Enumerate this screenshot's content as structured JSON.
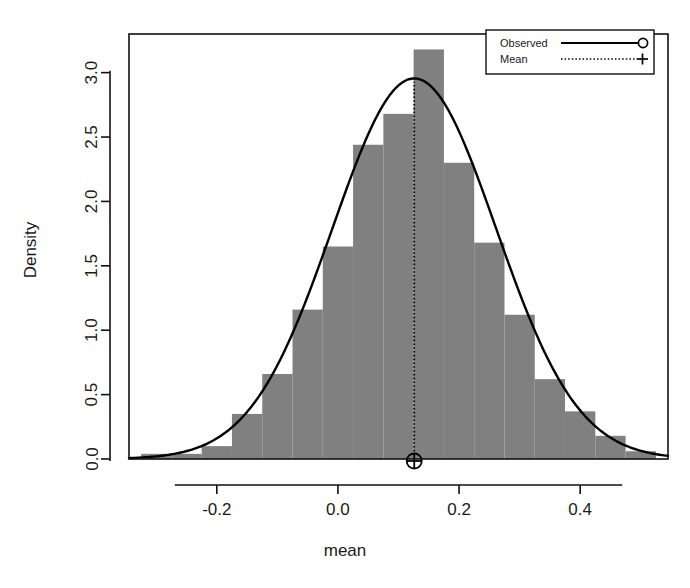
{
  "chart_data": {
    "type": "bar",
    "title": "",
    "subtitle": "",
    "xlabel": "mean",
    "ylabel": "Density",
    "xlim": [
      -0.345,
      0.545
    ],
    "ylim": [
      0.0,
      3.3
    ],
    "xticks": [
      -0.2,
      0.0,
      0.2,
      0.4
    ],
    "xticklabels": [
      "-0.2",
      "0.0",
      "0.2",
      "0.4"
    ],
    "yticks": [
      0.0,
      0.5,
      1.0,
      1.5,
      2.0,
      2.5,
      3.0
    ],
    "yticklabels": [
      "0.0",
      "0.5",
      "1.0",
      "1.5",
      "2.0",
      "2.5",
      "3.0"
    ],
    "grid": false,
    "bin_width": 0.05,
    "bin_edges": [
      -0.325,
      -0.275,
      -0.225,
      -0.175,
      -0.125,
      -0.075,
      -0.025,
      0.025,
      0.075,
      0.125,
      0.175,
      0.225,
      0.275,
      0.325,
      0.375,
      0.425,
      0.475,
      0.525
    ],
    "bin_centers": [
      -0.3,
      -0.25,
      -0.2,
      -0.15,
      -0.1,
      -0.05,
      0.0,
      0.05,
      0.1,
      0.15,
      0.2,
      0.25,
      0.3,
      0.35,
      0.4,
      0.45,
      0.5
    ],
    "values": [
      0.04,
      0.04,
      0.1,
      0.35,
      0.66,
      1.16,
      1.65,
      2.44,
      2.68,
      3.18,
      2.3,
      1.68,
      1.12,
      0.62,
      0.37,
      0.18,
      0.06
    ],
    "series": [
      {
        "name": "Histogram",
        "kind": "bar",
        "values": [
          0.04,
          0.04,
          0.1,
          0.35,
          0.66,
          1.16,
          1.65,
          2.44,
          2.68,
          3.18,
          2.3,
          1.68,
          1.12,
          0.62,
          0.37,
          0.18,
          0.06
        ]
      },
      {
        "name": "Observed",
        "kind": "line",
        "distribution": "normal",
        "mean": 0.126,
        "sd": 0.135,
        "peak": 2.95
      },
      {
        "name": "Mean",
        "kind": "vline",
        "x": 0.126,
        "marker": "circle-plus",
        "line_style": "dotted"
      }
    ],
    "annotations": {
      "mean_value": 0.126,
      "mean_marker_label": "mean-marker"
    },
    "legend": {
      "position": "top-right",
      "entries": [
        {
          "label": "Observed",
          "style": "solid-line-circle"
        },
        {
          "label": "Mean",
          "style": "dotted-line-plus"
        }
      ]
    },
    "colors": {
      "bar_fill": "#808080",
      "curve": "#000000",
      "axis": "#111111",
      "background": "#ffffff",
      "text": "#1a1a1a"
    }
  }
}
